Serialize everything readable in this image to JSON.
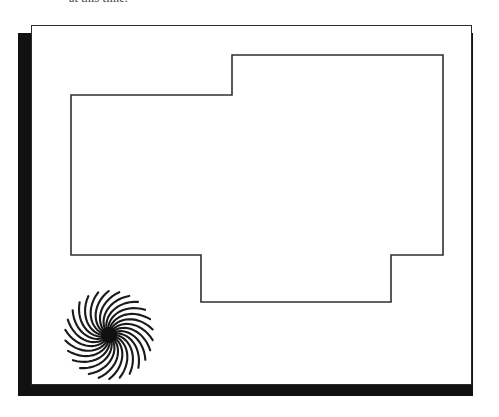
{
  "document": {
    "caption_text": "at this time.",
    "page_label": "scanned-page-sheet",
    "background_color": "#ffffff",
    "ink_color": "#2b2b2b",
    "shadow_color": "#111111"
  },
  "drawing": {
    "title": "floor-plan-outline",
    "stroke_color": "#2f2f2f",
    "stroke_width": 1.6,
    "fill": "none",
    "outline_points": "40,70 201,70 201,30 412,30 412,230 360,230 360,277 170,277 170,230 40,230 40,70",
    "vertices": [
      {
        "x": 40,
        "y": 70
      },
      {
        "x": 201,
        "y": 70
      },
      {
        "x": 201,
        "y": 30
      },
      {
        "x": 412,
        "y": 30
      },
      {
        "x": 412,
        "y": 230
      },
      {
        "x": 360,
        "y": 230
      },
      {
        "x": 360,
        "y": 277
      },
      {
        "x": 170,
        "y": 277
      },
      {
        "x": 170,
        "y": 230
      },
      {
        "x": 40,
        "y": 230
      }
    ]
  },
  "ornament": {
    "name": "spiral-rosette",
    "spoke_count": 26,
    "inner_radius": 7,
    "outer_radius": 44,
    "sweep_degrees": 62,
    "stroke_color": "#1a1a1a",
    "stroke_width": 2.1,
    "center_x": 47,
    "center_y": 47,
    "core_radius": 8
  }
}
